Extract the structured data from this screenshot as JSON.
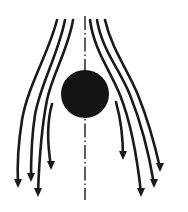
{
  "diagram": {
    "title": "Flow around a sphere (streamlines)",
    "colors": {
      "stroke": "#1a1a1a",
      "body": "#141414",
      "background": "#ffffff"
    },
    "body": {
      "shape": "circle",
      "cx": 85,
      "cy": 94,
      "r": 24
    },
    "centerline": {
      "x": 85,
      "y1": 16,
      "y2": 200,
      "style": "dash-dot"
    },
    "streamlines": [
      {
        "id": "left-outer",
        "d": "M57,20 C48,55 28,85 22,120 C18,145 17,165 18,184",
        "tip": [
          18,
          188
        ]
      },
      {
        "id": "left-mid",
        "d": "M65,20 C58,55 40,85 35,115 C31,140 31,160 31,178",
        "tip": [
          31,
          182
        ]
      },
      {
        "id": "left-inner",
        "d": "M73,20 C68,50 52,75 47,100 C41,130 39,165 38,193",
        "tip": [
          38,
          197
        ]
      },
      {
        "id": "left-wake",
        "d": "M52,104 C46,125 48,148 51,166",
        "tip": [
          51,
          170
        ]
      },
      {
        "id": "right-inner",
        "d": "M90,20 C94,50 110,70 120,95 C132,125 138,165 141,193",
        "tip": [
          141,
          197
        ]
      },
      {
        "id": "right-mid",
        "d": "M97,20 C102,50 120,70 130,95 C142,125 150,160 154,184",
        "tip": [
          154,
          188
        ]
      },
      {
        "id": "right-outer",
        "d": "M105,20 C112,50 128,70 138,95 C150,125 156,150 160,168",
        "tip": [
          160,
          172
        ]
      },
      {
        "id": "right-wake",
        "d": "M116,102 C121,120 123,140 123,156",
        "tip": [
          123,
          160
        ]
      }
    ]
  }
}
